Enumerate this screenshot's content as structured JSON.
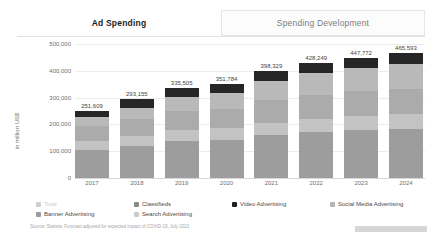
{
  "tabs": [
    {
      "label": "Ad Spending",
      "active": true
    },
    {
      "label": "Spending Development",
      "active": false
    }
  ],
  "source": "Source: Statista; Forecast adjusted for expected impact of COVID-19, July 2021",
  "legend": [
    {
      "label": "Total",
      "color": "#cfcfcf",
      "muted": true
    },
    {
      "label": "Classifieds",
      "color": "#8a8a8a",
      "muted": false
    },
    {
      "label": "Video Advertising",
      "color": "#1f1f1f",
      "muted": false
    },
    {
      "label": "Social Media Advertising",
      "color": "#b4b4b4",
      "muted": false
    },
    {
      "label": "Banner Advertising",
      "color": "#9b9b9b",
      "muted": false
    },
    {
      "label": "Search Advertising",
      "color": "#c9c9c9",
      "muted": false
    }
  ],
  "chart_data": {
    "type": "bar",
    "stacked": true,
    "title": "Ad Spending",
    "xlabel": "",
    "ylabel": "in million US$",
    "ylim": [
      0,
      500000
    ],
    "yticks": [
      0,
      100000,
      200000,
      300000,
      400000,
      500000
    ],
    "ytick_labels": [
      "0",
      "100,000",
      "200,000",
      "300,000",
      "400,000",
      "500,000"
    ],
    "grid": true,
    "legend_position": "bottom",
    "categories": [
      "2017",
      "2018",
      "2019",
      "2020",
      "2021",
      "2022",
      "2023",
      "2024"
    ],
    "totals": [
      251609,
      293155,
      335505,
      351784,
      398329,
      428249,
      447772,
      465593
    ],
    "total_labels": [
      "251,609",
      "293,155",
      "335,505",
      "351,784",
      "398,329",
      "428,249",
      "447,772",
      "465,593"
    ],
    "series": [
      {
        "name": "Search Advertising",
        "color": "#9d9d9d",
        "values": [
          106000,
          121000,
          137000,
          142000,
          160000,
          171000,
          178000,
          184000
        ]
      },
      {
        "name": "Classifieds",
        "color": "#c3c3c3",
        "values": [
          33000,
          37000,
          41000,
          43000,
          47000,
          50000,
          52000,
          54000
        ]
      },
      {
        "name": "Banner Advertising",
        "color": "#ababab",
        "values": [
          55000,
          63000,
          71000,
          74000,
          83000,
          89000,
          93000,
          96000
        ]
      },
      {
        "name": "Social Media Advertising",
        "color": "#b9b9b9",
        "values": [
          32000,
          42000,
          55000,
          60000,
          73000,
          81000,
          86000,
          91000
        ]
      },
      {
        "name": "Video Advertising",
        "color": "#262626",
        "values": [
          25609,
          30155,
          31505,
          32784,
          35329,
          37249,
          38772,
          40593
        ]
      }
    ]
  }
}
